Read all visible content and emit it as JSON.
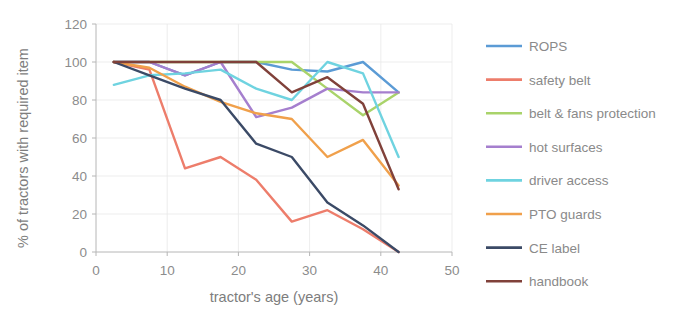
{
  "chart_data": {
    "type": "line",
    "title": "",
    "xlabel": "tractor's age (years)",
    "ylabel": "% of tractors with required item",
    "xlim": [
      0,
      50
    ],
    "ylim": [
      0,
      120
    ],
    "xticks": [
      0,
      10,
      20,
      30,
      40,
      50
    ],
    "yticks": [
      0,
      20,
      40,
      60,
      80,
      100,
      120
    ],
    "xtick_labels": [
      "0",
      "10",
      "20",
      "30",
      "40",
      "50"
    ],
    "ytick_labels": [
      "0",
      "20",
      "40",
      "60",
      "80",
      "100",
      "120"
    ],
    "grid": true,
    "legend_position": "right",
    "x": [
      2.5,
      7.5,
      12.5,
      17.5,
      22.5,
      27.5,
      32.5,
      37.5,
      42.5
    ],
    "series": [
      {
        "name": "ROPS",
        "color": "#5b9bd5",
        "values": [
          100,
          100,
          93,
          100,
          100,
          96,
          95,
          100,
          84
        ]
      },
      {
        "name": "safety belt",
        "color": "#ed7d6b",
        "values": [
          100,
          96,
          44,
          50,
          38,
          16,
          22,
          12,
          0
        ]
      },
      {
        "name": "belt & fans protection",
        "color": "#a9d36a",
        "values": [
          100,
          100,
          100,
          100,
          100,
          100,
          86,
          72,
          84
        ]
      },
      {
        "name": "hot surfaces",
        "color": "#a57fce",
        "values": [
          100,
          100,
          93,
          100,
          71,
          76,
          86,
          84,
          84
        ]
      },
      {
        "name": "driver access",
        "color": "#6fd3e0",
        "values": [
          88,
          93,
          94,
          96,
          86,
          80,
          100,
          94,
          50
        ]
      },
      {
        "name": "PTO guards",
        "color": "#f0a04b",
        "values": [
          100,
          97,
          87,
          79,
          73,
          70,
          50,
          59,
          35
        ]
      },
      {
        "name": "CE label",
        "color": "#3b4a66",
        "values": [
          100,
          93,
          86,
          80,
          57,
          50,
          26,
          14,
          0
        ]
      },
      {
        "name": "handbook",
        "color": "#80413a",
        "values": [
          100,
          100,
          100,
          100,
          100,
          84,
          92,
          78,
          33
        ]
      }
    ]
  },
  "axes": {
    "x_title": "tractor's age (years)",
    "y_title": "% of tractors with required item"
  },
  "legend": {
    "items": [
      {
        "label": "ROPS",
        "color": "#5b9bd5"
      },
      {
        "label": "safety belt",
        "color": "#ed7d6b"
      },
      {
        "label": "belt & fans protection",
        "color": "#a9d36a"
      },
      {
        "label": "hot surfaces",
        "color": "#a57fce"
      },
      {
        "label": "driver access",
        "color": "#6fd3e0"
      },
      {
        "label": "PTO guards",
        "color": "#f0a04b"
      },
      {
        "label": "CE label",
        "color": "#3b4a66"
      },
      {
        "label": "handbook",
        "color": "#80413a"
      }
    ]
  }
}
